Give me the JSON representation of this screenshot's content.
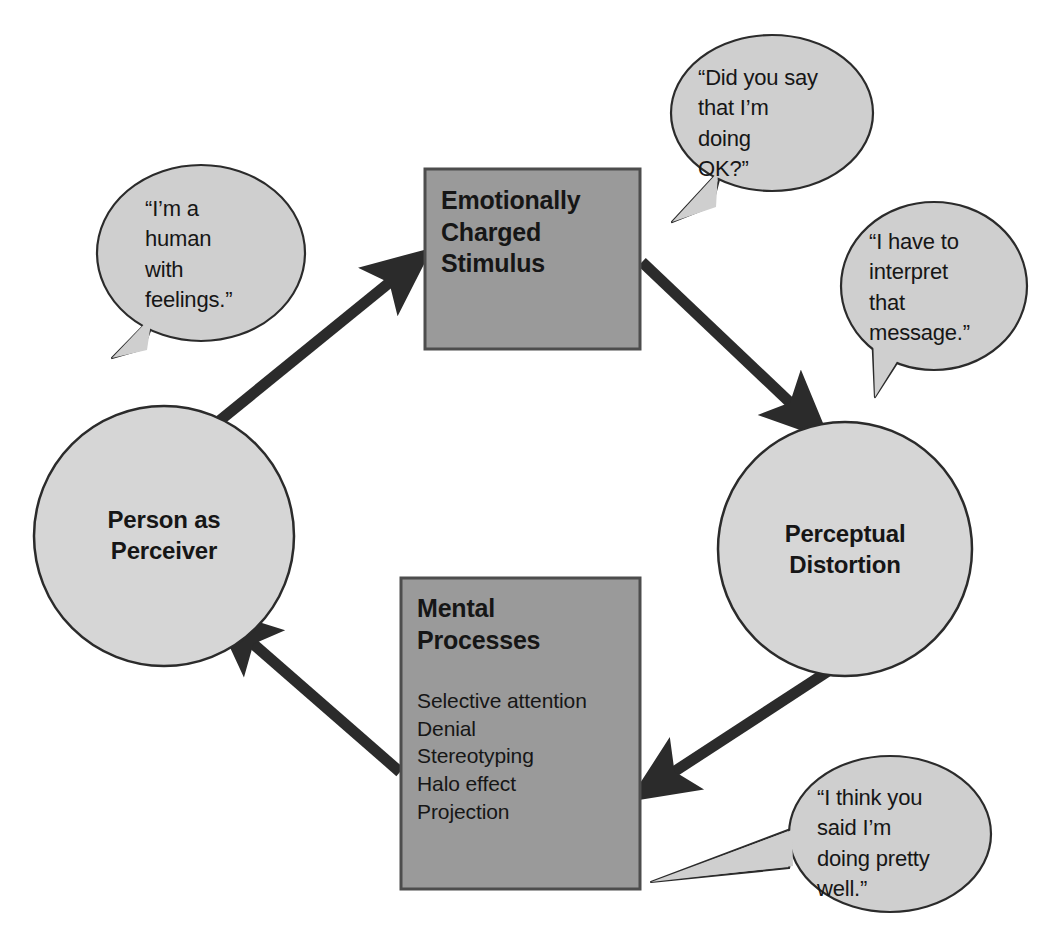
{
  "diagram": {
    "colors": {
      "background": "#ffffff",
      "box_fill": "#9a9a9a",
      "box_stroke": "#4d4d4d",
      "circle_fill": "#d6d6d6",
      "circle_stroke": "#2b2b2b",
      "bubble_fill": "#cfcfcf",
      "bubble_stroke": "#2b2b2b",
      "arrow": "#2b2b2b",
      "text": "#161616"
    }
  },
  "nodes": {
    "stimulus_box": {
      "title_lines": [
        "Emotionally",
        "Charged",
        "Stimulus"
      ],
      "shape": "rectangle"
    },
    "perceptual_circle": {
      "label_lines": [
        "Perceptual",
        "Distortion"
      ],
      "shape": "circle"
    },
    "mental_box": {
      "title_lines": [
        "Mental",
        "Processes"
      ],
      "items": [
        "Selective attention",
        "Denial",
        "Stereotyping",
        "Halo effect",
        "Projection"
      ],
      "shape": "rectangle"
    },
    "person_circle": {
      "label_lines": [
        "Person as",
        "Perceiver"
      ],
      "shape": "circle"
    }
  },
  "bubbles": [
    {
      "id": "bubble-human-feelings",
      "lines": [
        "“I’m a",
        "human",
        "with",
        "feelings.”"
      ],
      "points_to": "person-as-perceiver"
    },
    {
      "id": "bubble-did-you-say",
      "lines": [
        "“Did you say",
        "that I’m",
        "doing",
        "OK?”"
      ],
      "points_to": "emotionally-charged-stimulus"
    },
    {
      "id": "bubble-interpret-message",
      "lines": [
        "“I have to",
        "interpret",
        "that",
        "message.”"
      ],
      "points_to": "perceptual-distortion"
    },
    {
      "id": "bubble-doing-pretty-well",
      "lines": [
        "“I think you",
        "said I’m",
        "doing pretty",
        "well.”"
      ],
      "points_to": "mental-processes"
    }
  ],
  "arrows": [
    {
      "id": "arrow-person-to-stimulus",
      "from": "Person as Perceiver",
      "to": "Emotionally Charged Stimulus"
    },
    {
      "id": "arrow-stimulus-to-perceptual",
      "from": "Emotionally Charged Stimulus",
      "to": "Perceptual Distortion"
    },
    {
      "id": "arrow-perceptual-to-mental",
      "from": "Perceptual Distortion",
      "to": "Mental Processes"
    },
    {
      "id": "arrow-mental-to-person",
      "from": "Mental Processes",
      "to": "Person as Perceiver"
    }
  ]
}
